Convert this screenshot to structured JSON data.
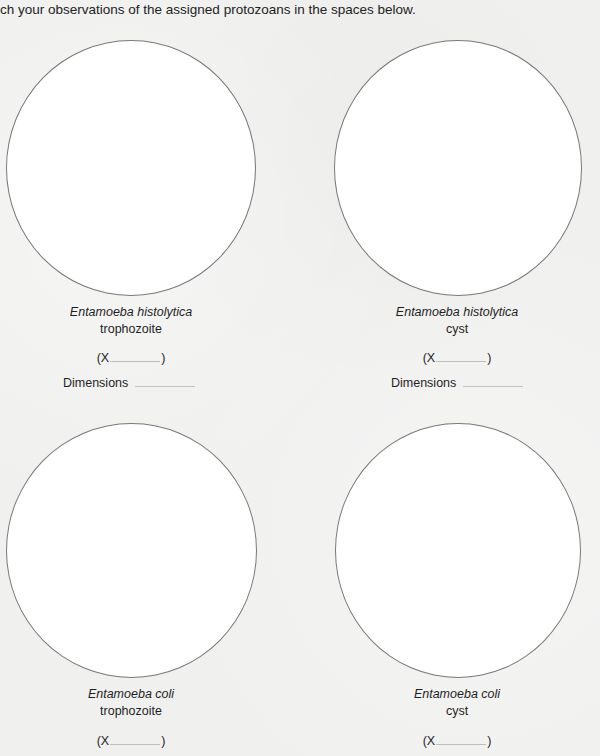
{
  "instruction": "ch your observations of the assigned protozoans in the spaces below.",
  "panels": [
    {
      "species": "Entamoeba histolytica",
      "stage": "trophozoite",
      "magnification_prefix": "(X",
      "magnification_suffix": ")",
      "magnification_value": "",
      "dimensions_label": "Dimensions",
      "dimensions_value": ""
    },
    {
      "species": "Entamoeba histolytica",
      "stage": "cyst",
      "magnification_prefix": "(X",
      "magnification_suffix": ")",
      "magnification_value": "",
      "dimensions_label": "Dimensions",
      "dimensions_value": ""
    },
    {
      "species": "Entamoeba coli",
      "stage": "trophozoite",
      "magnification_prefix": "(X",
      "magnification_suffix": ")",
      "magnification_value": ""
    },
    {
      "species": "Entamoeba coli",
      "stage": "cyst",
      "magnification_prefix": "(X",
      "magnification_suffix": ")",
      "magnification_value": ""
    }
  ],
  "colors": {
    "background": "#f0f0ef",
    "circle_fill": "#ffffff",
    "circle_stroke": "#787878",
    "text": "#1f1f1f"
  }
}
